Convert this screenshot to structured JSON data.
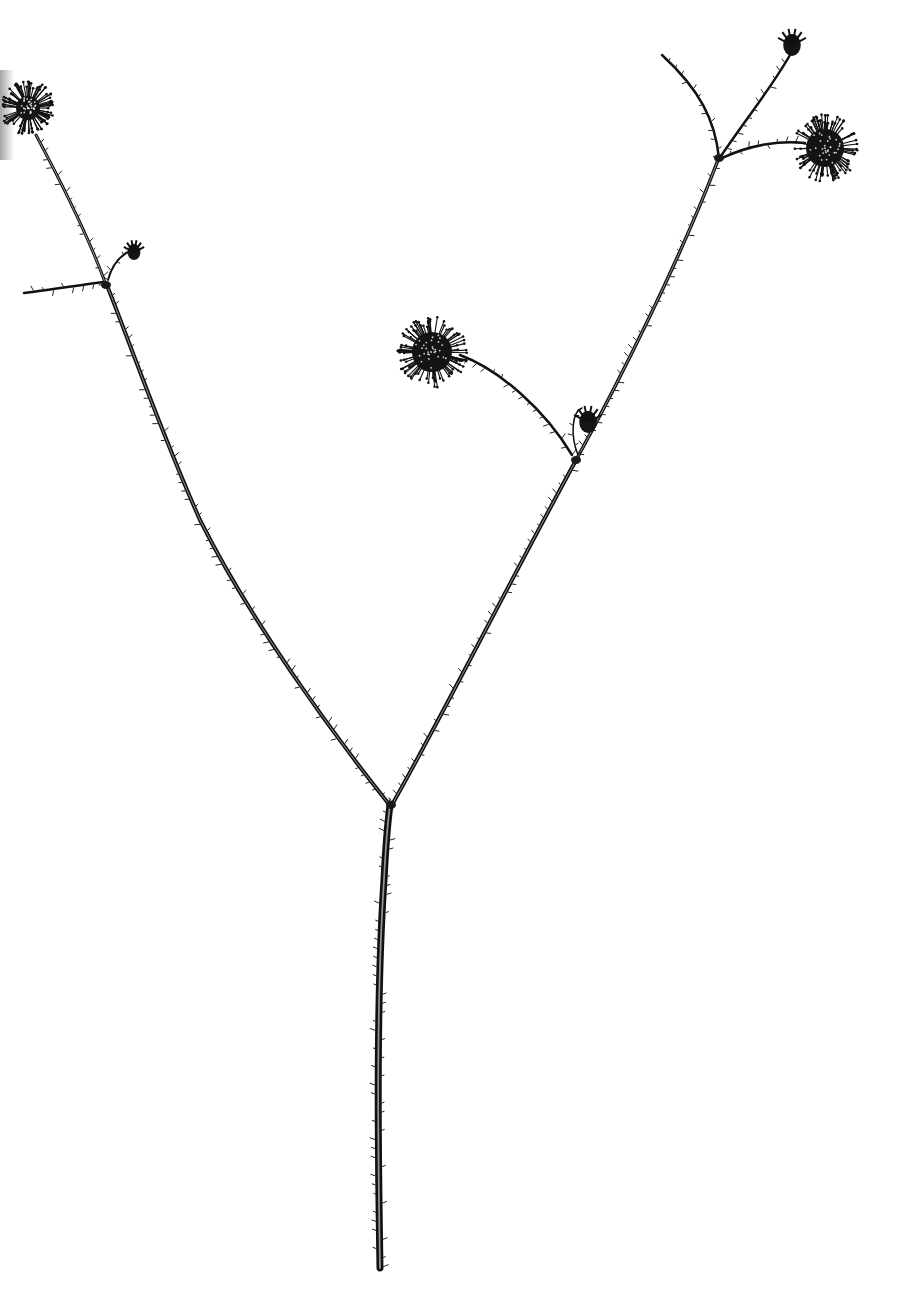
{
  "image": {
    "subject": "pen-and-ink botanical illustration of a branching stem with spherical flower heads",
    "background": "#ffffff",
    "ink": "#111111"
  },
  "stems": [
    {
      "name": "main-stem",
      "d": "M380,1268 C378,1150 376,1000 384,880 C386,840 388,820 390,805",
      "width": 7
    },
    {
      "name": "left-branch",
      "d": "M388,803 C330,730 250,620 200,520 C160,430 125,330 108,288",
      "width": 4
    },
    {
      "name": "left-upper-stem",
      "d": "M106,285 C90,240 60,180 36,135",
      "width": 3
    },
    {
      "name": "left-side-shoot",
      "d": "M104,282 C80,285 50,290 24,293",
      "width": 2.5
    },
    {
      "name": "left-bud-stalk",
      "d": "M108,280 C112,265 120,255 132,250",
      "width": 2
    },
    {
      "name": "right-branch",
      "d": "M393,803 C440,720 500,600 575,462",
      "width": 4
    },
    {
      "name": "right-upper-stem",
      "d": "M575,462 C620,380 680,260 718,160",
      "width": 3.5
    },
    {
      "name": "middle-flower-stalk",
      "d": "M572,455 C545,410 500,370 460,355",
      "width": 2.5
    },
    {
      "name": "bud-loop-stalk",
      "d": "M578,455 C570,435 572,412 582,408",
      "width": 1.5
    },
    {
      "name": "top-left-twig",
      "d": "M719,158 C715,120 700,90 662,55",
      "width": 2.5
    },
    {
      "name": "top-bud-stalk",
      "d": "M721,156 C745,120 770,90 790,55",
      "width": 2.5
    },
    {
      "name": "top-right-flower-stalk",
      "d": "M722,158 C750,145 780,140 805,143",
      "width": 2.5
    }
  ],
  "flower_heads": [
    {
      "name": "flower-head-top-left",
      "cx": 28,
      "cy": 108,
      "r": 26,
      "core": 12
    },
    {
      "name": "flower-head-middle",
      "cx": 432,
      "cy": 352,
      "r": 34,
      "core": 20
    },
    {
      "name": "flower-head-top-right",
      "cx": 825,
      "cy": 148,
      "r": 32,
      "core": 19
    }
  ],
  "buds": [
    {
      "name": "bud-left-small",
      "cx": 134,
      "cy": 252,
      "r": 8
    },
    {
      "name": "bud-top",
      "cx": 792,
      "cy": 45,
      "r": 11
    },
    {
      "name": "bud-middle-drooping",
      "cx": 588,
      "cy": 422,
      "r": 11
    }
  ],
  "nodes": [
    {
      "name": "node-fork",
      "cx": 391,
      "cy": 805
    },
    {
      "name": "node-left",
      "cx": 106,
      "cy": 285
    },
    {
      "name": "node-right-mid",
      "cx": 576,
      "cy": 460
    },
    {
      "name": "node-right-top",
      "cx": 719,
      "cy": 158
    }
  ]
}
